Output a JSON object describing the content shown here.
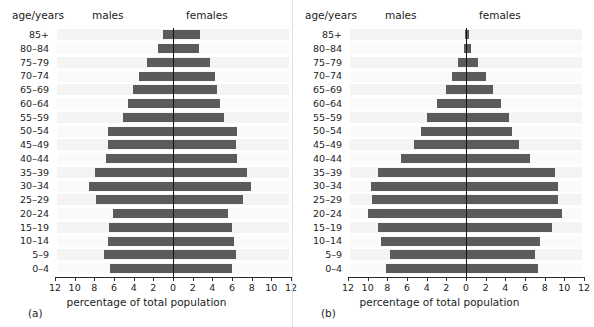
{
  "figure": {
    "axis_title": "percentage of total population",
    "age_header": "age/years",
    "males_header": "males",
    "females_header": "females",
    "bar_color": "#5b5b5b",
    "axis_color": "#2b2b2b",
    "tick_labels": [
      "12",
      "10",
      "8",
      "6",
      "4",
      "2",
      "0",
      "2",
      "4",
      "6",
      "8",
      "10",
      "12"
    ],
    "tick_values": [
      -12,
      -10,
      -8,
      -6,
      -4,
      -2,
      0,
      2,
      4,
      6,
      8,
      10,
      12
    ],
    "age_groups": [
      "85+",
      "80–84",
      "75–79",
      "70–74",
      "65–69",
      "60–64",
      "55–59",
      "50–54",
      "45–49",
      "40–44",
      "35–39",
      "30–34",
      "25–29",
      "20–24",
      "15–19",
      "10–14",
      "5–9",
      "0–4"
    ],
    "panel_a_caption": "(a)",
    "panel_b_caption": "(b)"
  },
  "chart_data": [
    {
      "type": "bar",
      "subtype": "population-pyramid",
      "panel": "(a)",
      "title": "",
      "xlabel": "percentage of total population",
      "ylabel": "age/years",
      "xlim": [
        -12,
        12
      ],
      "grid": false,
      "legend": "none",
      "orientation": "horizontal",
      "categories": [
        "85+",
        "80–84",
        "75–79",
        "70–74",
        "65–69",
        "60–64",
        "55–59",
        "50–54",
        "45–49",
        "40–44",
        "35–39",
        "30–34",
        "25–29",
        "20–24",
        "15–19",
        "10–14",
        "5–9",
        "0–4"
      ],
      "series": [
        {
          "name": "males",
          "side": "left",
          "values": [
            1.0,
            1.5,
            2.6,
            3.5,
            4.1,
            4.6,
            5.1,
            6.6,
            6.6,
            6.8,
            7.9,
            8.5,
            7.8,
            6.1,
            6.5,
            6.6,
            7.0,
            6.4
          ]
        },
        {
          "name": "females",
          "side": "right",
          "values": [
            2.7,
            2.6,
            3.8,
            4.3,
            4.5,
            4.8,
            5.2,
            6.5,
            6.4,
            6.5,
            7.5,
            7.9,
            7.1,
            5.6,
            6.0,
            6.2,
            6.4,
            6.0
          ]
        }
      ]
    },
    {
      "type": "bar",
      "subtype": "population-pyramid",
      "panel": "(b)",
      "title": "",
      "xlabel": "percentage of total population",
      "ylabel": "age/years",
      "xlim": [
        -12,
        12
      ],
      "grid": false,
      "legend": "none",
      "orientation": "horizontal",
      "categories": [
        "85+",
        "80–84",
        "75–79",
        "70–74",
        "65–69",
        "60–64",
        "55–59",
        "50–54",
        "45–49",
        "40–44",
        "35–39",
        "30–34",
        "25–29",
        "20–24",
        "15–19",
        "10–14",
        "5–9",
        "0–4"
      ],
      "series": [
        {
          "name": "males",
          "side": "left",
          "values": [
            0.15,
            0.25,
            0.8,
            1.4,
            2.0,
            3.0,
            4.0,
            4.6,
            5.3,
            6.6,
            9.0,
            9.7,
            9.6,
            10.0,
            9.0,
            8.6,
            7.7,
            8.1
          ]
        },
        {
          "name": "females",
          "side": "right",
          "values": [
            0.3,
            0.5,
            1.2,
            2.0,
            2.7,
            3.6,
            4.4,
            4.7,
            5.4,
            6.5,
            9.0,
            9.4,
            9.4,
            9.8,
            8.7,
            7.5,
            7.0,
            7.3
          ]
        }
      ]
    }
  ]
}
